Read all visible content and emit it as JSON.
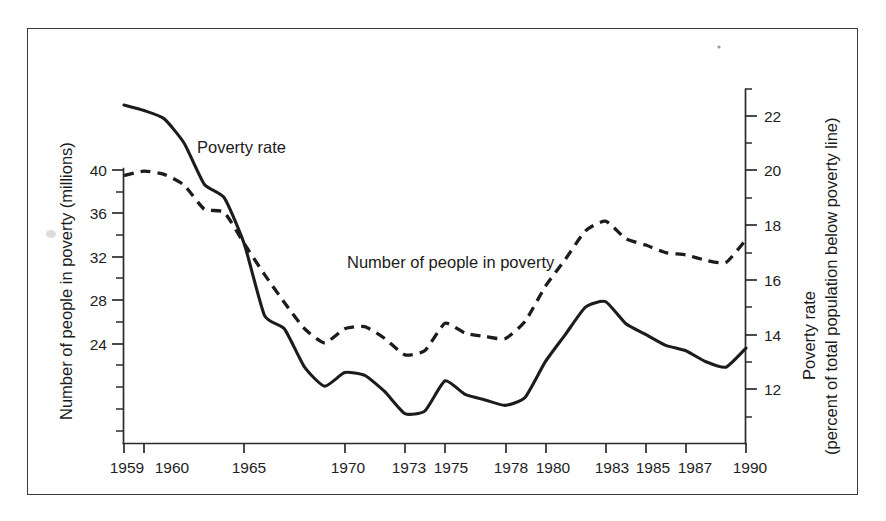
{
  "chart_data": {
    "type": "line",
    "title": "",
    "subtitle": "",
    "xlabel": "",
    "ylabel": "Number of people in poverty (millions)",
    "y2label": "Poverty rate (percent of total population below poverty line)",
    "grid": false,
    "legend_position": "inline-annotation",
    "x": [
      1959,
      1960,
      1961,
      1962,
      1963,
      1964,
      1965,
      1966,
      1967,
      1968,
      1969,
      1970,
      1971,
      1972,
      1973,
      1974,
      1975,
      1976,
      1977,
      1978,
      1979,
      1980,
      1981,
      1982,
      1983,
      1984,
      1985,
      1986,
      1987,
      1988,
      1989,
      1990
    ],
    "xlim": [
      1959,
      1990
    ],
    "xticks": [
      1959,
      1960,
      1965,
      1970,
      1973,
      1975,
      1978,
      1980,
      1983,
      1985,
      1987,
      1990
    ],
    "xticklabels": [
      "1959",
      "1960",
      "1965",
      "1970",
      "1973",
      "1975",
      "1978",
      "1980",
      "1983",
      "1985",
      "1987",
      "1990"
    ],
    "xticks_minor": [
      1961,
      1962,
      1963,
      1964,
      1966,
      1967,
      1968,
      1969,
      1971,
      1972,
      1974,
      1976,
      1977,
      1979,
      1981,
      1982,
      1984,
      1986,
      1988,
      1989
    ],
    "ylim": [
      22,
      41
    ],
    "yticks": [
      40,
      36,
      32,
      28,
      24
    ],
    "yticklabels": [
      "40",
      "36",
      "32",
      "28",
      "24"
    ],
    "yticks_minor": [
      38,
      34,
      30,
      26,
      22
    ],
    "y2lim": [
      11,
      23
    ],
    "y2ticks": [
      22,
      20,
      18,
      16,
      14,
      12
    ],
    "y2ticklabels": [
      "22",
      "20",
      "18",
      "16",
      "14",
      "12"
    ],
    "y2ticks_minor": [
      23,
      21,
      19,
      17,
      15,
      13,
      11
    ],
    "series": [
      {
        "name": "Poverty rate",
        "axis": "right",
        "style": "solid",
        "units": "percent of total population below poverty line",
        "label_text": "Poverty rate",
        "values": [
          22.4,
          22.2,
          21.9,
          21.0,
          19.5,
          19.0,
          17.3,
          14.7,
          14.2,
          12.8,
          12.1,
          12.6,
          12.5,
          11.9,
          11.1,
          11.2,
          12.3,
          11.8,
          11.6,
          11.4,
          11.7,
          13.0,
          14.0,
          15.0,
          15.2,
          14.4,
          14.0,
          13.6,
          13.4,
          13.0,
          12.8,
          13.5
        ]
      },
      {
        "name": "Number of people in poverty",
        "axis": "left",
        "style": "dashed",
        "units": "millions",
        "label_text": "Number of people in poverty",
        "values": [
          39.5,
          39.9,
          39.6,
          38.6,
          36.4,
          36.1,
          33.2,
          30.4,
          27.8,
          25.4,
          24.1,
          25.4,
          25.6,
          24.5,
          23.0,
          23.4,
          25.9,
          25.0,
          24.7,
          24.5,
          26.1,
          29.3,
          31.8,
          34.4,
          35.3,
          33.7,
          33.1,
          32.4,
          32.2,
          31.7,
          31.5,
          33.6
        ]
      }
    ],
    "annotations": [
      {
        "text": "Poverty rate",
        "x_px": 197,
        "y_px": 153
      },
      {
        "text": "Number of people in poverty",
        "x_px": 347,
        "y_px": 268
      }
    ]
  }
}
